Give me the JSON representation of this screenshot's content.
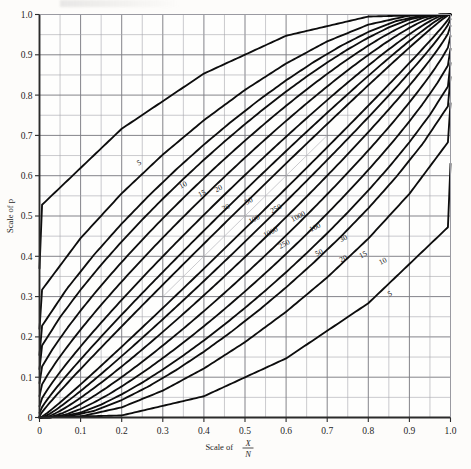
{
  "figure": {
    "background_color": "#fdfcfa",
    "grid_color": "#8d8d93",
    "curve_color": "#0d0d0d",
    "axis_color": "#2b2b2b"
  },
  "axes": {
    "x_title_prefix": "Scale of ",
    "x_title_numerator": "X",
    "x_title_denominator": "N",
    "y_title": "Scale of p",
    "x_ticks": [
      "0",
      "0.1",
      "0.2",
      "0.3",
      "0.4",
      "0.5",
      "0.6",
      "0.7",
      "0.8",
      "0.9",
      "1.0"
    ],
    "y_ticks": [
      "0",
      "0.1",
      "0.2",
      "0.3",
      "0.4",
      "0.5",
      "0.6",
      "0.7",
      "0.8",
      "0.9",
      "1.0"
    ],
    "xlim": [
      0,
      1
    ],
    "ylim": [
      0,
      1
    ],
    "major_step": 0.1,
    "minor_step": 0.05,
    "grid": true
  },
  "chart_data": {
    "type": "line",
    "title": "",
    "subtitle": "",
    "xlabel": "Scale of X/N",
    "ylabel": "Scale of p",
    "xlim": [
      0,
      1
    ],
    "ylim": [
      0,
      1
    ],
    "grid": true,
    "legend": "inline-curve-labels",
    "sample_sizes": [
      5,
      10,
      15,
      20,
      30,
      50,
      100,
      250,
      1000
    ],
    "upper_branch_y_intercepts_at_x0": [
      0.37,
      0.22,
      0.155,
      0.12,
      0.085,
      0.053,
      0.028,
      0.0115,
      0.0029
    ],
    "lower_branch_y_values_at_x1": [
      0.63,
      0.78,
      0.845,
      0.88,
      0.915,
      0.947,
      0.972,
      0.9885,
      0.9971
    ],
    "upper_labels": [
      "5",
      "10",
      "15",
      "20",
      "30",
      "50",
      "100",
      "250",
      "1000"
    ],
    "lower_labels": [
      "1000",
      "250",
      "100",
      "50",
      "30",
      "20",
      "15",
      "10",
      "5"
    ],
    "label_positions_upper": [
      {
        "n": 5,
        "text": "5",
        "x": 0.245,
        "y": 0.627
      },
      {
        "n": 10,
        "text": "10",
        "x": 0.352,
        "y": 0.572
      },
      {
        "n": 15,
        "text": "15",
        "x": 0.398,
        "y": 0.551
      },
      {
        "n": 20,
        "text": "20",
        "x": 0.438,
        "y": 0.563
      },
      {
        "n": 30,
        "text": "30",
        "x": 0.456,
        "y": 0.516
      },
      {
        "n": 50,
        "text": "50",
        "x": 0.512,
        "y": 0.532
      },
      {
        "n": 100,
        "text": "100",
        "x": 0.525,
        "y": 0.487
      },
      {
        "n": 250,
        "text": "250",
        "x": 0.578,
        "y": 0.513
      },
      {
        "n": 1000,
        "text": "1000",
        "x": 0.632,
        "y": 0.494
      }
    ],
    "label_positions_lower": [
      {
        "n": 1000,
        "text": "1000",
        "x": 0.565,
        "y": 0.455
      },
      {
        "n": 250,
        "text": "250",
        "x": 0.598,
        "y": 0.425
      },
      {
        "n": 100,
        "text": "100",
        "x": 0.673,
        "y": 0.467
      },
      {
        "n": 50,
        "text": "50",
        "x": 0.683,
        "y": 0.404
      },
      {
        "n": 30,
        "text": "30",
        "x": 0.742,
        "y": 0.439
      },
      {
        "n": 20,
        "text": "20",
        "x": 0.742,
        "y": 0.389
      },
      {
        "n": 15,
        "text": "15",
        "x": 0.79,
        "y": 0.399
      },
      {
        "n": 10,
        "text": "10",
        "x": 0.838,
        "y": 0.383
      },
      {
        "n": 5,
        "text": "5",
        "x": 0.855,
        "y": 0.302
      }
    ]
  }
}
